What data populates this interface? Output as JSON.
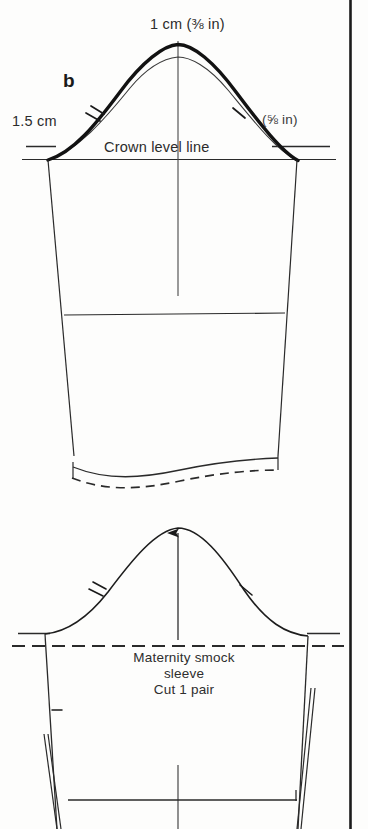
{
  "page": {
    "kind": "sewing-pattern-diagram",
    "background_color": "#fdfdfc",
    "ink_color": "#1f1f1f",
    "width": 368,
    "height": 829
  },
  "upper_diagram": {
    "name": "sleeve cap alteration diagram b",
    "step_label": "b",
    "labels": {
      "cap_height_raise": "1 cm (⅜ in)",
      "underarm_lower": "1.5 cm",
      "seam_allowance": "(⅝ in)",
      "crown_level_line": "Crown level line"
    },
    "notches": {
      "front_single": 1,
      "back_double": 2
    },
    "lines": {
      "original_cap_curve": "thin",
      "new_cap_curve": "thick",
      "hem_line": "solid",
      "original_hem": "dashed"
    }
  },
  "lower_diagram": {
    "name": "finished maternity smock sleeve pattern",
    "text_block": [
      "Maternity smock",
      "sleeve",
      "Cut 1 pair"
    ],
    "grainline": "arrow-up",
    "crown_level_line_style": "dashed",
    "notches": {
      "front_single": 1,
      "back_double": 2
    }
  },
  "icons": {
    "grainline_arrow": "arrow-up-icon",
    "notch_single": "notch-single-icon",
    "notch_double": "notch-double-icon",
    "page_rule": "vertical-rule-icon"
  }
}
